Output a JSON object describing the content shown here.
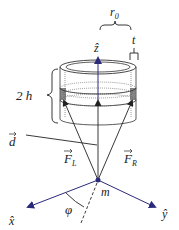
{
  "diagram": {
    "labels": {
      "r0": "r",
      "r0_sub": "0",
      "t": "t",
      "z_hat": "ẑ",
      "two_h": "2 h",
      "d_vec": "d",
      "F_L": "F",
      "F_L_sub": "L",
      "F_R": "F",
      "F_R_sub": "R",
      "m": "m",
      "phi": "φ",
      "x_hat": "x̂",
      "y_hat": "ŷ"
    },
    "colors": {
      "axis": "#2b2a7a",
      "line": "#222222",
      "shade": "#555555"
    }
  }
}
